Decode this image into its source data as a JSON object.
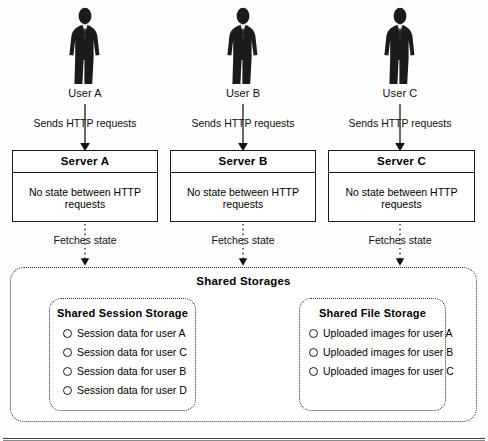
{
  "diagram": {
    "users": [
      {
        "icon": "person-icon",
        "label": "User A"
      },
      {
        "icon": "person-icon",
        "label": "User B"
      },
      {
        "icon": "person-icon",
        "label": "User C"
      }
    ],
    "request_arrows": [
      {
        "label": "Sends HTTP requests",
        "style": "solid"
      },
      {
        "label": "Sends HTTP requests",
        "style": "solid"
      },
      {
        "label": "Sends HTTP requests",
        "style": "solid"
      }
    ],
    "servers": [
      {
        "name": "Server A",
        "body": "No state between HTTP requests"
      },
      {
        "name": "Server B",
        "body": "No state between HTTP requests"
      },
      {
        "name": "Server C",
        "body": "No state between HTTP requests"
      }
    ],
    "fetch_arrows": [
      {
        "label": "Fetches state",
        "style": "dotted"
      },
      {
        "label": "Fetches state",
        "style": "dotted"
      },
      {
        "label": "Fetches state",
        "style": "dotted"
      }
    ],
    "storages": {
      "title": "Shared Storages",
      "boxes": [
        {
          "title": "Shared Session Storage",
          "items": [
            "Session data for user A",
            "Session data for user C",
            "Session data for user B",
            "Session data for user D"
          ]
        },
        {
          "title": "Shared File Storage",
          "items": [
            "Uploaded images for user A",
            "Uploaded images for user B",
            "Uploaded images for user C"
          ]
        }
      ]
    },
    "colors": {
      "ink": "#1a1a1a",
      "silhouette": "#1b1b1b",
      "dotted_border": "#2b2b2b",
      "background": "#fdfdfd"
    }
  }
}
